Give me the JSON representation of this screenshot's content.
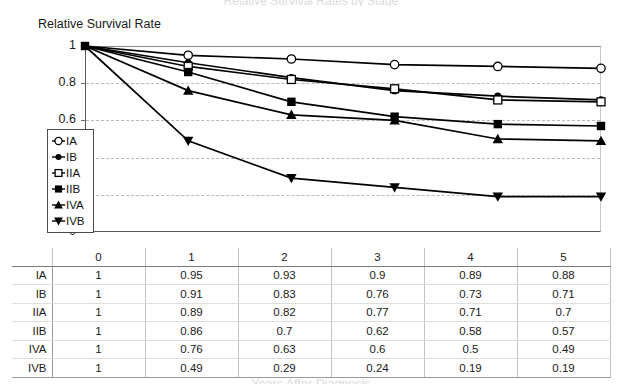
{
  "figure": {
    "top_title_partial": "Relative Survival Rates by Stage",
    "y_axis_title": "Relative Survival Rate",
    "x_axis_title_partial": "Years After Diagnosis"
  },
  "chart_data": {
    "type": "line",
    "title": "Relative Survival Rates by Stage",
    "xlabel": "Years After Diagnosis",
    "ylabel": "Relative Survival Rate",
    "x": [
      0,
      1,
      2,
      3,
      4,
      5
    ],
    "categories": [
      "0",
      "1",
      "2",
      "3",
      "4",
      "5"
    ],
    "xtick_labels": [
      "0",
      "1",
      "2",
      "3",
      "4",
      "5"
    ],
    "ytick_labels": [
      "0",
      "0.2",
      "0.4",
      "0.6",
      "0.8",
      "1"
    ],
    "ytick_values": [
      0,
      0.2,
      0.4,
      0.6,
      0.8,
      1
    ],
    "ylim": [
      0,
      1
    ],
    "xlim": [
      0,
      5
    ],
    "grid": "horizontal-dashed",
    "legend_position": "inside-left",
    "series": [
      {
        "name": "IA",
        "marker": "open-circle",
        "values": [
          1,
          0.95,
          0.93,
          0.9,
          0.89,
          0.88
        ]
      },
      {
        "name": "IB",
        "marker": "filled-circle",
        "values": [
          1,
          0.91,
          0.83,
          0.76,
          0.73,
          0.71
        ]
      },
      {
        "name": "IIA",
        "marker": "open-square",
        "values": [
          1,
          0.89,
          0.82,
          0.77,
          0.71,
          0.7
        ]
      },
      {
        "name": "IIB",
        "marker": "filled-square",
        "values": [
          1,
          0.86,
          0.7,
          0.62,
          0.58,
          0.57
        ]
      },
      {
        "name": "IVA",
        "marker": "filled-triangle-up",
        "values": [
          1,
          0.76,
          0.63,
          0.6,
          0.5,
          0.49
        ]
      },
      {
        "name": "IVB",
        "marker": "filled-triangle-down",
        "values": [
          1,
          0.49,
          0.29,
          0.24,
          0.19,
          0.19
        ]
      }
    ]
  },
  "legend": {
    "items": [
      {
        "label": "IA",
        "marker": "open-circle"
      },
      {
        "label": "IB",
        "marker": "filled-circle"
      },
      {
        "label": "IIA",
        "marker": "open-square"
      },
      {
        "label": "IIB",
        "marker": "filled-square"
      },
      {
        "label": "IVA",
        "marker": "filled-triangle-up"
      },
      {
        "label": "IVB",
        "marker": "filled-triangle-down"
      }
    ]
  },
  "table": {
    "corner_label": "",
    "columns": [
      "0",
      "1",
      "2",
      "3",
      "4",
      "5"
    ],
    "rows": [
      {
        "label": "IA",
        "cells": [
          "1",
          "0.95",
          "0.93",
          "0.9",
          "0.89",
          "0.88"
        ]
      },
      {
        "label": "IB",
        "cells": [
          "1",
          "0.91",
          "0.83",
          "0.76",
          "0.73",
          "0.71"
        ]
      },
      {
        "label": "IIA",
        "cells": [
          "1",
          "0.89",
          "0.82",
          "0.77",
          "0.71",
          "0.7"
        ]
      },
      {
        "label": "IIB",
        "cells": [
          "1",
          "0.86",
          "0.7",
          "0.62",
          "0.58",
          "0.57"
        ]
      },
      {
        "label": "IVA",
        "cells": [
          "1",
          "0.76",
          "0.63",
          "0.6",
          "0.5",
          "0.49"
        ]
      },
      {
        "label": "IVB",
        "cells": [
          "1",
          "0.49",
          "0.29",
          "0.24",
          "0.19",
          "0.19"
        ]
      }
    ]
  },
  "colors": {
    "series_line": "#000000",
    "grid": "#b9b9b9",
    "axis": "#595959",
    "text": "#1a1a1a"
  }
}
